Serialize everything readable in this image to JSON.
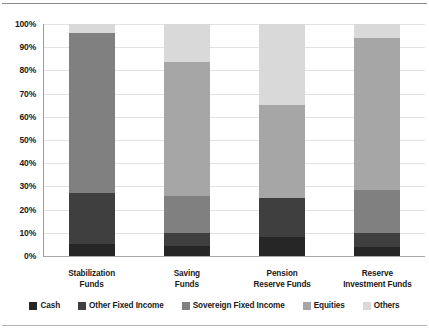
{
  "chart_data": {
    "type": "bar",
    "subtype": "stacked-column-100",
    "title": "",
    "xlabel": "",
    "ylabel": "",
    "ylim": [
      0,
      100
    ],
    "grid": true,
    "legend_position": "bottom",
    "categories": [
      "Stabilization\nFunds",
      "Saving\nFunds",
      "Pension\nReserve Funds",
      "Reserve\nInvestment Funds"
    ],
    "category_lines": [
      [
        "Stabilization",
        "Funds"
      ],
      [
        "Saving",
        "Funds"
      ],
      [
        "Pension",
        "Reserve Funds"
      ],
      [
        "Reserve",
        "Investment Funds"
      ]
    ],
    "ytick_labels": [
      "100%",
      "90%",
      "80%",
      "70%",
      "60%",
      "50%",
      "40%",
      "30%",
      "20%",
      "10%",
      "0%"
    ],
    "ytick_values": [
      100,
      90,
      80,
      70,
      60,
      50,
      40,
      30,
      20,
      10,
      0
    ],
    "series": [
      {
        "name": "Cash",
        "color": "#262626",
        "values": [
          5,
          4.5,
          8,
          4
        ]
      },
      {
        "name": "Other Fixed Income",
        "color": "#3f3f3f",
        "values": [
          22,
          5.5,
          17,
          6
        ]
      },
      {
        "name": "Sovereign Fixed Income",
        "color": "#808080",
        "values": [
          69,
          16,
          0,
          18.5
        ]
      },
      {
        "name": "Equities",
        "color": "#a6a6a6",
        "values": [
          0,
          57.5,
          40,
          65.5
        ]
      },
      {
        "name": "Others",
        "color": "#d9d9d9",
        "values": [
          4,
          16.5,
          35,
          6
        ]
      }
    ]
  }
}
